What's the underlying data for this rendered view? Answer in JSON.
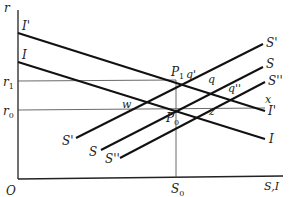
{
  "diagram": {
    "type": "economics-savings-investment",
    "axes": {
      "y_label": "r",
      "x_label": "S,I",
      "origin_label": "O",
      "y_ticks": [
        {
          "label": "r",
          "sub": "1",
          "y": 81
        },
        {
          "label": "r",
          "sub": "0",
          "y": 110
        }
      ],
      "x_ticks": [
        {
          "label": "S",
          "sub": "0",
          "x": 176
        }
      ]
    },
    "curves": [
      {
        "name": "I'",
        "label": "I'",
        "left_label": "I'",
        "x1": 18,
        "y1": 33,
        "x2": 265,
        "y2": 111
      },
      {
        "name": "I",
        "label": "I",
        "left_label": "I",
        "x1": 18,
        "y1": 62,
        "x2": 265,
        "y2": 139
      },
      {
        "name": "S'",
        "label": "S'",
        "start_label": "S'",
        "x1": 76,
        "y1": 138,
        "x2": 263,
        "y2": 44
      },
      {
        "name": "S",
        "label": "S",
        "start_label": "S",
        "x1": 101,
        "y1": 150,
        "x2": 263,
        "y2": 67
      },
      {
        "name": "S''",
        "label": "S''",
        "start_label": "S''",
        "x1": 120,
        "y1": 158,
        "x2": 265,
        "y2": 82
      }
    ],
    "points": [
      {
        "label": "P",
        "sub": "1"
      },
      {
        "label": "P",
        "sub": "0"
      },
      {
        "label": "q'"
      },
      {
        "label": "q"
      },
      {
        "label": "q''"
      },
      {
        "label": "w"
      },
      {
        "label": "z"
      },
      {
        "label": "x"
      }
    ],
    "labels": {
      "r": "r",
      "O": "O",
      "SI": "S,I",
      "r1_main": "r",
      "r1_sub": "1",
      "r0_main": "r",
      "r0_sub": "0",
      "S0_main": "S",
      "S0_sub": "0",
      "Iprime_left": "I'",
      "I_left": "I",
      "Iprime_right": "I'",
      "I_right": "I",
      "Sprime_top": "S'",
      "S_top": "S",
      "Sdbl_top": "S''",
      "Sprime_bottom": "S'",
      "S_bottom": "S",
      "Sdbl_bottom": "S''",
      "P1_main": "P",
      "P1_sub": "1",
      "P0_main": "P",
      "P0_sub": "0",
      "qprime": "q'",
      "q": "q",
      "qdbl": "q''",
      "w": "w",
      "z": "z",
      "x": "x"
    }
  }
}
